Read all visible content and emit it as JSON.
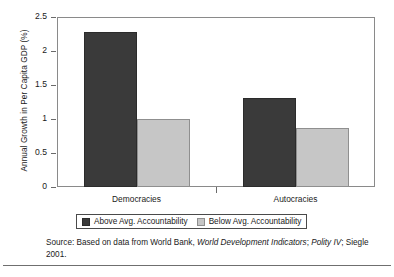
{
  "chart_data": {
    "type": "bar",
    "title": "",
    "subtitle": "",
    "xlabel": "",
    "ylabel": "Annual Growth in Per Capita GDP (%)",
    "categories": [
      "Democracies",
      "Autocracies"
    ],
    "ylim": [
      0,
      2.5
    ],
    "yticks": [
      "0",
      "0.5",
      "1",
      "1.5",
      "2",
      "2.5"
    ],
    "ytick_values": [
      0,
      0.5,
      1,
      1.5,
      2,
      2.5
    ],
    "grid": false,
    "legend_position": "bottom-center",
    "series": [
      {
        "name": "Above Avg. Accountability",
        "color": "#3a3a3a",
        "values": [
          2.28,
          1.31
        ]
      },
      {
        "name": "Below Avg. Accountability",
        "color": "#c6c6c6",
        "values": [
          1.0,
          0.87
        ]
      }
    ],
    "source_note_line1_prefix": "Source: Based on data from World Bank, ",
    "source_note_line1_italic": "World Development Indicators",
    "source_note_line1_suffix": ";",
    "source_note_line2_italic": "Polity IV",
    "source_note_line2_suffix": "; Siegle 2001."
  },
  "colors": {
    "above_avg": "#3a3a3a",
    "below_avg": "#c6c6c6",
    "axis": "#6a6a6a",
    "frame": "#8a8a8a",
    "text": "#1a1a1a",
    "background": "#ffffff"
  }
}
